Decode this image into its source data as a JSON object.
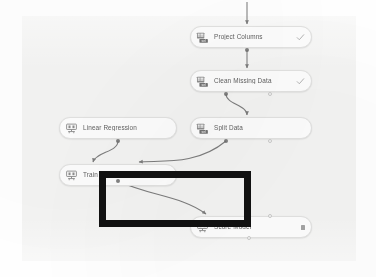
{
  "app": {
    "surface_name": "pipeline-canvas",
    "canvas_background": "#f4f4f3",
    "page_background": "#ffffff"
  },
  "colors": {
    "node_fill": "#fdfdfd",
    "node_border": "#e2e2e1",
    "label_text": "#4a4a4a",
    "wire": "#7c7c7c",
    "port_filled": "#6c6c6c",
    "port_hollow": "#fafafa",
    "annotation": "#111111"
  },
  "nodes": [
    {
      "id": "project-columns",
      "label": "Project Columns",
      "icon": "data-transform-icon",
      "status": "check",
      "status_icon": "check-icon"
    },
    {
      "id": "clean-missing-data",
      "label": "Clean Missing Data",
      "icon": "data-transform-icon",
      "status": "check",
      "status_icon": "check-icon"
    },
    {
      "id": "linear-regression",
      "label": "Linear Regression",
      "icon": "machine-learning-model-icon",
      "status": "none",
      "status_icon": ""
    },
    {
      "id": "split-data",
      "label": "Split Data",
      "icon": "data-transform-icon",
      "status": "none",
      "status_icon": ""
    },
    {
      "id": "train-model",
      "label": "Train Model",
      "icon": "machine-learning-model-icon",
      "status": "none",
      "status_icon": ""
    },
    {
      "id": "score-model",
      "label": "Score Model",
      "icon": "machine-learning-model-icon",
      "status": "running",
      "status_icon": "running-chip-icon"
    }
  ],
  "annotation": {
    "name": "highlight-rectangle",
    "shape": "rectangle",
    "color": "#111111"
  }
}
